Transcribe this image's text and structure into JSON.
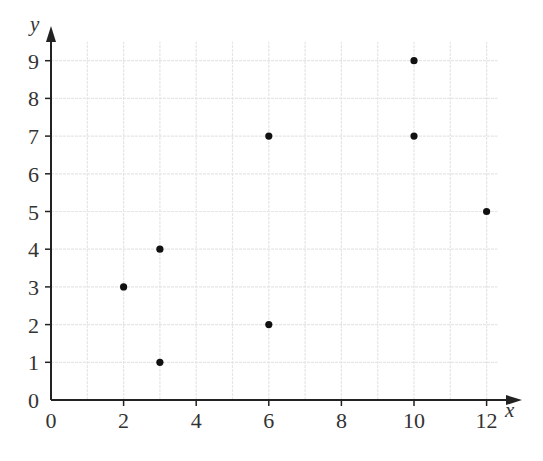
{
  "chart_data": {
    "type": "scatter",
    "title": "",
    "xlabel": "x",
    "ylabel": "y",
    "xlim": [
      0,
      12
    ],
    "ylim": [
      0,
      9
    ],
    "x_ticks": [
      0,
      2,
      4,
      6,
      8,
      10,
      12
    ],
    "y_ticks": [
      0,
      1,
      2,
      3,
      4,
      5,
      6,
      7,
      8,
      9
    ],
    "grid": true,
    "grid_step": {
      "x": 1,
      "y": 1
    },
    "legend": null,
    "points": [
      {
        "x": 2,
        "y": 3
      },
      {
        "x": 3,
        "y": 1
      },
      {
        "x": 3,
        "y": 4
      },
      {
        "x": 6,
        "y": 2
      },
      {
        "x": 6,
        "y": 7
      },
      {
        "x": 10,
        "y": 7
      },
      {
        "x": 10,
        "y": 9
      },
      {
        "x": 12,
        "y": 5
      }
    ],
    "colors": {
      "points": "#111111",
      "axes": "#222222",
      "grid": "#e6e6e6"
    }
  }
}
